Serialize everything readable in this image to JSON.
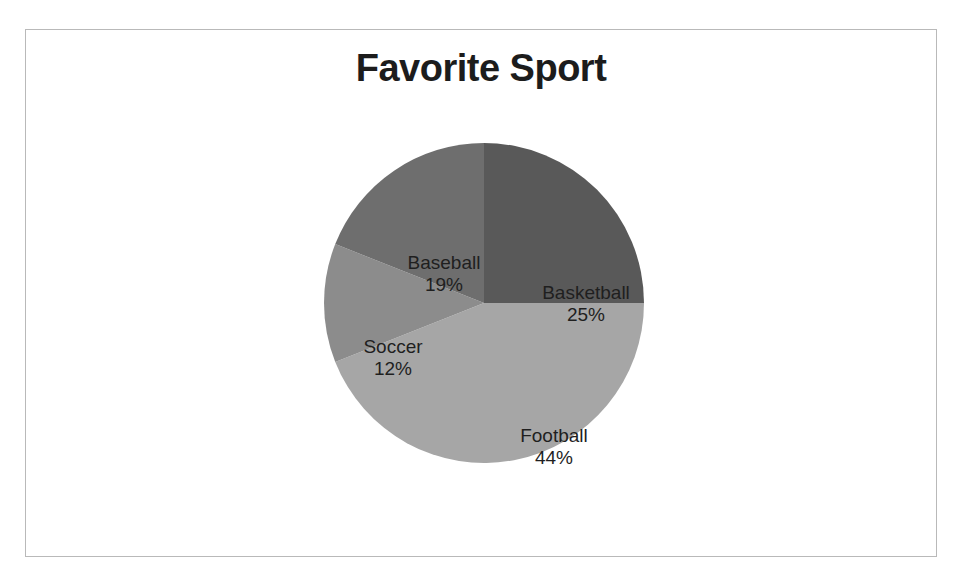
{
  "chart_data": {
    "type": "pie",
    "title": "Favorite Sport",
    "categories": [
      "Basketball",
      "Football",
      "Soccer",
      "Baseball"
    ],
    "values": [
      25,
      44,
      12,
      19
    ],
    "value_suffix": "%",
    "labels": [
      {
        "name": "Basketball",
        "value": "25%"
      },
      {
        "name": "Football",
        "value": "44%"
      },
      {
        "name": "Soccer",
        "value": "12%"
      },
      {
        "name": "Baseball",
        "value": "19%"
      }
    ],
    "colors": [
      "#595959",
      "#a6a6a6",
      "#8c8c8c",
      "#6e6e6e"
    ],
    "start_angle_deg": 0,
    "direction": "clockwise",
    "legend": "none",
    "grid": false,
    "labels_position": "inside-slices",
    "xlabel": "",
    "ylabel": ""
  },
  "frame": {
    "border_color": "#b9b9b9",
    "background": "#ffffff"
  },
  "title": {
    "text": "Favorite Sport",
    "color": "#1c1c1c"
  }
}
